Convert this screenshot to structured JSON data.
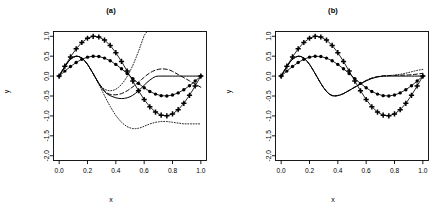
{
  "figure": {
    "background_color": "#ffffff",
    "ink_color": "#000000",
    "width": 444,
    "height": 209
  },
  "panels": [
    {
      "id": "a",
      "title": "(a)",
      "xlabel": "x",
      "ylabel": "y"
    },
    {
      "id": "b",
      "title": "(b)",
      "xlabel": "x",
      "ylabel": "y"
    }
  ],
  "axes": {
    "x_ticks": [
      "0.0",
      "0.2",
      "0.4",
      "0.6",
      "0.8",
      "1.0"
    ],
    "x_tick_values": [
      0.0,
      0.2,
      0.4,
      0.6,
      0.8,
      1.0
    ],
    "y_ticks": [
      "1.0",
      "0.5",
      "0.0",
      "-0.5",
      "-1.0",
      "-1.5",
      "-2.0"
    ],
    "y_tick_values": [
      1.0,
      0.5,
      0.0,
      -0.5,
      -1.0,
      -1.5,
      -2.0
    ],
    "xlim": [
      -0.04,
      1.04
    ],
    "ylim": [
      -2.12,
      1.12
    ],
    "grid": false
  },
  "chart_data": [
    {
      "type": "line",
      "panel": "a",
      "title": "(a)",
      "xlabel": "x",
      "ylabel": "y",
      "xlim": [
        -0.04,
        1.04
      ],
      "ylim": [
        -2.12,
        1.12
      ],
      "grid": false,
      "legend": "none",
      "x": [
        0.0,
        0.02,
        0.04,
        0.06,
        0.08,
        0.1,
        0.12,
        0.14,
        0.16,
        0.18,
        0.2,
        0.22,
        0.24,
        0.26,
        0.28,
        0.3,
        0.32,
        0.34,
        0.36,
        0.38,
        0.4,
        0.42,
        0.44,
        0.46,
        0.48,
        0.5,
        0.52,
        0.54,
        0.56,
        0.58,
        0.6,
        0.62,
        0.64,
        0.66,
        0.68,
        0.7,
        0.72,
        0.74,
        0.76,
        0.78,
        0.8,
        0.82,
        0.84,
        0.86,
        0.88,
        0.9,
        0.92,
        0.94,
        0.96,
        0.98,
        1.0
      ],
      "series": [
        {
          "name": "sin-amplitude-1",
          "style": "solid-with-plus-markers",
          "marker": "plus",
          "amplitude": 1.0,
          "formula": "sin(2*pi*x)",
          "marker_x": [
            0.0,
            0.04,
            0.08,
            0.12,
            0.16,
            0.2,
            0.24,
            0.28,
            0.32,
            0.36,
            0.4,
            0.44,
            0.48,
            0.52,
            0.56,
            0.6,
            0.64,
            0.68,
            0.72,
            0.76,
            0.8,
            0.84,
            0.88,
            0.92,
            0.96,
            1.0
          ],
          "marker_y": [
            0.0,
            0.249,
            0.482,
            0.685,
            0.844,
            0.951,
            0.998,
            0.982,
            0.904,
            0.771,
            0.588,
            0.368,
            0.125,
            -0.125,
            -0.368,
            -0.588,
            -0.771,
            -0.904,
            -0.982,
            -0.998,
            -0.951,
            -0.844,
            -0.685,
            -0.482,
            -0.249,
            0.0
          ]
        },
        {
          "name": "sin-amplitude-0.5",
          "style": "solid-with-circle-markers",
          "marker": "filled-circle",
          "amplitude": 0.5,
          "formula": "0.5*sin(2*pi*x)",
          "marker_x": [
            0.0,
            0.04,
            0.08,
            0.12,
            0.16,
            0.2,
            0.24,
            0.28,
            0.32,
            0.36,
            0.4,
            0.44,
            0.48,
            0.52,
            0.56,
            0.6,
            0.64,
            0.68,
            0.72,
            0.76,
            0.8,
            0.84,
            0.88,
            0.92,
            0.96,
            1.0
          ],
          "marker_y": [
            0.0,
            0.125,
            0.241,
            0.342,
            0.422,
            0.476,
            0.499,
            0.491,
            0.452,
            0.386,
            0.294,
            0.184,
            0.063,
            -0.063,
            -0.184,
            -0.294,
            -0.386,
            -0.452,
            -0.491,
            -0.499,
            -0.476,
            -0.422,
            -0.342,
            -0.241,
            -0.125,
            0.0
          ]
        },
        {
          "name": "fit-solid",
          "style": "solid",
          "description": "solid fitted curve, follows 0.5 sine then flattens near -0.55 after x=0.75 and rises to 0 at x=1.0",
          "values": [
            0.0,
            0.125,
            0.241,
            0.342,
            0.422,
            0.476,
            0.499,
            0.491,
            0.452,
            0.386,
            0.294,
            0.184,
            0.063,
            -0.063,
            -0.184,
            -0.294,
            -0.386,
            -0.452,
            -0.491,
            -0.52,
            -0.545,
            -0.56,
            -0.565,
            -0.56,
            -0.545,
            -0.52,
            -0.48,
            -0.43,
            -0.37,
            -0.3,
            -0.23,
            -0.16,
            -0.1,
            -0.05,
            -0.01,
            0.0,
            0.0,
            0.0,
            0.0,
            0.0,
            0.0,
            0.0,
            0.0,
            0.0,
            0.0,
            0.0,
            0.0,
            0.0,
            0.0,
            0.0,
            0.0
          ]
        },
        {
          "name": "fit-dashed",
          "style": "dashed",
          "description": "dashed fitted curve, shallower trough near -0.45, rises above solid after x=0.85",
          "values": [
            0.0,
            0.125,
            0.241,
            0.342,
            0.422,
            0.476,
            0.499,
            0.491,
            0.452,
            0.386,
            0.294,
            0.184,
            0.063,
            -0.063,
            -0.184,
            -0.29,
            -0.375,
            -0.43,
            -0.46,
            -0.47,
            -0.47,
            -0.46,
            -0.44,
            -0.41,
            -0.37,
            -0.32,
            -0.27,
            -0.21,
            -0.15,
            -0.09,
            -0.03,
            0.03,
            0.08,
            0.12,
            0.15,
            0.17,
            0.18,
            0.18,
            0.17,
            0.15,
            0.12,
            0.08,
            0.04,
            0.0,
            -0.04,
            -0.08,
            -0.12,
            -0.16,
            -0.2,
            -0.24,
            -0.28
          ]
        },
        {
          "name": "fit-dotted-upper",
          "style": "dotted",
          "description": "dotted curve diverging strongly upward after x=0.6, exits top of panel near x=0.95",
          "values": [
            0.0,
            0.125,
            0.241,
            0.342,
            0.422,
            0.476,
            0.499,
            0.491,
            0.452,
            0.386,
            0.294,
            0.184,
            0.063,
            -0.063,
            -0.18,
            -0.27,
            -0.33,
            -0.36,
            -0.37,
            -0.36,
            -0.33,
            -0.28,
            -0.21,
            -0.12,
            -0.01,
            0.12,
            0.27,
            0.44,
            0.62,
            0.82,
            1.02,
            1.12,
            1.12,
            1.12,
            1.12,
            1.12,
            1.12,
            1.12,
            1.12,
            1.12,
            1.12,
            1.12,
            1.12,
            1.12,
            1.12,
            1.12,
            1.12,
            1.12,
            1.12,
            1.12,
            1.12
          ]
        },
        {
          "name": "fit-dotted-lower",
          "style": "dotted",
          "description": "dotted curve diverging downward, trough near -1.32 around x=0.86 then rising",
          "values": [
            0.0,
            0.125,
            0.241,
            0.342,
            0.422,
            0.476,
            0.499,
            0.491,
            0.452,
            0.386,
            0.294,
            0.184,
            0.063,
            -0.07,
            -0.21,
            -0.35,
            -0.49,
            -0.63,
            -0.76,
            -0.88,
            -0.99,
            -1.08,
            -1.16,
            -1.22,
            -1.27,
            -1.3,
            -1.32,
            -1.32,
            -1.31,
            -1.29,
            -1.26,
            -1.23,
            -1.2,
            -1.18,
            -1.16,
            -1.15,
            -1.14,
            -1.14,
            -1.14,
            -1.15,
            -1.16,
            -1.17,
            -1.18,
            -1.19,
            -1.2,
            -1.2,
            -1.2,
            -1.2,
            -1.2,
            -1.2,
            -1.2
          ]
        }
      ]
    },
    {
      "type": "line",
      "panel": "b",
      "title": "(b)",
      "xlabel": "x",
      "ylabel": "y",
      "xlim": [
        -0.04,
        1.04
      ],
      "ylim": [
        -2.12,
        1.12
      ],
      "grid": false,
      "legend": "none",
      "x": [
        0.0,
        0.02,
        0.04,
        0.06,
        0.08,
        0.1,
        0.12,
        0.14,
        0.16,
        0.18,
        0.2,
        0.22,
        0.24,
        0.26,
        0.28,
        0.3,
        0.32,
        0.34,
        0.36,
        0.38,
        0.4,
        0.42,
        0.44,
        0.46,
        0.48,
        0.5,
        0.52,
        0.54,
        0.56,
        0.58,
        0.6,
        0.62,
        0.64,
        0.66,
        0.68,
        0.7,
        0.72,
        0.74,
        0.76,
        0.78,
        0.8,
        0.82,
        0.84,
        0.86,
        0.88,
        0.9,
        0.92,
        0.94,
        0.96,
        0.98,
        1.0
      ],
      "series": [
        {
          "name": "sin-amplitude-1",
          "style": "solid-with-plus-markers",
          "marker": "plus",
          "amplitude": 1.0,
          "formula": "sin(2*pi*x)",
          "marker_x": [
            0.0,
            0.04,
            0.08,
            0.12,
            0.16,
            0.2,
            0.24,
            0.28,
            0.32,
            0.36,
            0.4,
            0.44,
            0.48,
            0.52,
            0.56,
            0.6,
            0.64,
            0.68,
            0.72,
            0.76,
            0.8,
            0.84,
            0.88,
            0.92,
            0.96,
            1.0
          ],
          "marker_y": [
            0.0,
            0.249,
            0.482,
            0.685,
            0.844,
            0.951,
            0.998,
            0.982,
            0.904,
            0.771,
            0.588,
            0.368,
            0.125,
            -0.125,
            -0.368,
            -0.588,
            -0.771,
            -0.904,
            -0.982,
            -0.998,
            -0.951,
            -0.844,
            -0.685,
            -0.482,
            -0.249,
            0.0
          ]
        },
        {
          "name": "sin-amplitude-0.5",
          "style": "solid-with-circle-markers",
          "marker": "filled-circle",
          "amplitude": 0.5,
          "formula": "0.5*sin(2*pi*x)",
          "marker_x": [
            0.0,
            0.04,
            0.08,
            0.12,
            0.16,
            0.2,
            0.24,
            0.28,
            0.32,
            0.36,
            0.4,
            0.44,
            0.48,
            0.52,
            0.56,
            0.6,
            0.64,
            0.68,
            0.72,
            0.76,
            0.8,
            0.84,
            0.88,
            0.92,
            0.96,
            1.0
          ],
          "marker_y": [
            0.0,
            0.125,
            0.241,
            0.342,
            0.422,
            0.476,
            0.499,
            0.491,
            0.452,
            0.386,
            0.294,
            0.184,
            0.063,
            -0.063,
            -0.184,
            -0.294,
            -0.386,
            -0.452,
            -0.491,
            -0.499,
            -0.476,
            -0.422,
            -0.342,
            -0.241,
            -0.125,
            0.0
          ]
        },
        {
          "name": "fit-solid",
          "style": "solid",
          "description": "solid fitted curve closely tracking the 0.5 sine across the whole domain",
          "values": [
            0.0,
            0.125,
            0.241,
            0.342,
            0.422,
            0.476,
            0.499,
            0.491,
            0.452,
            0.386,
            0.294,
            0.184,
            0.063,
            -0.063,
            -0.184,
            -0.294,
            -0.386,
            -0.452,
            -0.491,
            -0.499,
            -0.49,
            -0.47,
            -0.44,
            -0.4,
            -0.36,
            -0.32,
            -0.28,
            -0.24,
            -0.2,
            -0.16,
            -0.12,
            -0.09,
            -0.06,
            -0.04,
            -0.02,
            -0.01,
            0.0,
            0.0,
            0.0,
            0.0,
            0.0,
            0.0,
            0.0,
            0.0,
            0.0,
            0.0,
            0.0,
            0.0,
            0.0,
            0.0,
            0.0
          ]
        },
        {
          "name": "fit-dashed",
          "style": "dashed",
          "description": "dashed fitted curve nearly overlapping the solid fit, slight separation after x=0.9",
          "values": [
            0.0,
            0.126,
            0.243,
            0.344,
            0.424,
            0.478,
            0.5,
            0.492,
            0.453,
            0.387,
            0.295,
            0.185,
            0.064,
            -0.062,
            -0.183,
            -0.292,
            -0.383,
            -0.448,
            -0.486,
            -0.495,
            -0.487,
            -0.468,
            -0.438,
            -0.399,
            -0.358,
            -0.316,
            -0.274,
            -0.232,
            -0.19,
            -0.148,
            -0.108,
            -0.075,
            -0.048,
            -0.028,
            -0.013,
            -0.003,
            0.004,
            0.009,
            0.013,
            0.016,
            0.018,
            0.02,
            0.022,
            0.024,
            0.026,
            0.03,
            0.035,
            0.042,
            0.05,
            0.06,
            0.07
          ]
        },
        {
          "name": "fit-dotted",
          "style": "dotted",
          "description": "dotted fitted curve bundled with solid and dashed fits, diverging only slightly near x=1.0",
          "values": [
            0.0,
            0.124,
            0.239,
            0.34,
            0.42,
            0.474,
            0.497,
            0.489,
            0.451,
            0.385,
            0.293,
            0.183,
            0.062,
            -0.064,
            -0.186,
            -0.296,
            -0.388,
            -0.454,
            -0.493,
            -0.5,
            -0.492,
            -0.472,
            -0.442,
            -0.403,
            -0.362,
            -0.32,
            -0.278,
            -0.236,
            -0.194,
            -0.152,
            -0.112,
            -0.08,
            -0.054,
            -0.034,
            -0.019,
            -0.008,
            0.0,
            0.006,
            0.012,
            0.018,
            0.025,
            0.034,
            0.045,
            0.058,
            0.073,
            0.09,
            0.108,
            0.126,
            0.143,
            0.157,
            0.168
          ]
        }
      ]
    }
  ]
}
